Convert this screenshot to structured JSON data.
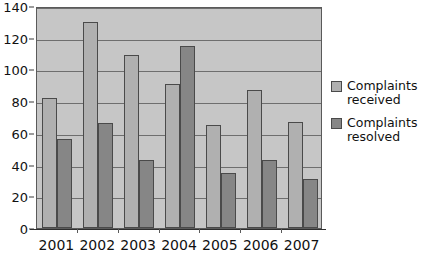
{
  "chart_data": {
    "type": "bar",
    "title": "",
    "xlabel": "",
    "ylabel": "",
    "categories": [
      "2001",
      "2002",
      "2003",
      "2004",
      "2005",
      "2006",
      "2007"
    ],
    "series": [
      {
        "name": "Complaints received",
        "color": "#b0b0b0",
        "values": [
          82,
          130,
          109,
          91,
          65,
          87,
          67
        ]
      },
      {
        "name": "Complaints resolved",
        "color": "#868686",
        "values": [
          56,
          66,
          43,
          115,
          35,
          43,
          31
        ]
      }
    ],
    "ylim": [
      0,
      140
    ],
    "yticks": [
      0,
      20,
      40,
      60,
      80,
      100,
      120,
      140
    ],
    "ytick_labels": [
      "0",
      "20",
      "40",
      "60",
      "80",
      "100",
      "120",
      "140"
    ],
    "grid": true,
    "grid_axis": "y",
    "legend_position": "right",
    "plot_background": "#c6c6c6",
    "page_background": "#ffffff"
  },
  "legend": {
    "items": [
      {
        "label": "Complaints received",
        "swatch": "received-swatch"
      },
      {
        "label": "Complaints resolved",
        "swatch": "resolved-swatch"
      }
    ]
  }
}
